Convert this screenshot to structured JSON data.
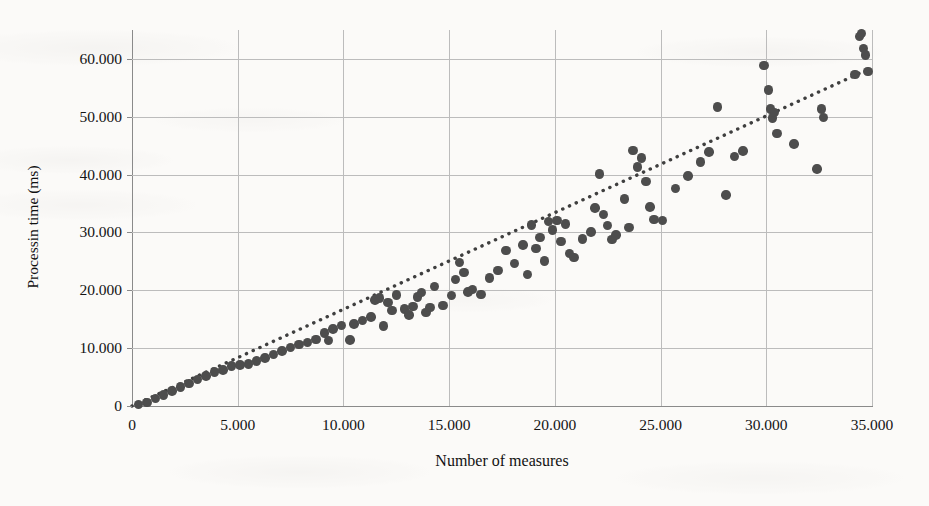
{
  "chart_data": {
    "type": "scatter",
    "title": "",
    "xlabel": "Number of measures",
    "ylabel": "Processin time (ms)",
    "xlim": [
      0,
      35000
    ],
    "ylim": [
      0,
      65000
    ],
    "grid": true,
    "legend": null,
    "xticks": [
      0,
      5000,
      10000,
      15000,
      20000,
      25000,
      30000,
      35000
    ],
    "xtick_labels": [
      "0",
      "5.000",
      "10.000",
      "15.000",
      "20.000",
      "25.000",
      "30.000",
      "35.000"
    ],
    "yticks": [
      0,
      10000,
      20000,
      30000,
      40000,
      50000,
      60000
    ],
    "ytick_labels": [
      "0",
      "10.000",
      "20.000",
      "30.000",
      "40.000",
      "50.000",
      "60.000"
    ],
    "marker_color": "#4d4d4d",
    "marker_size_px": 9.5,
    "gridline_color": "#bcbcbc",
    "axis_color": "#8a8a8a",
    "background_color": "#fbfaf8",
    "series": [
      {
        "name": "measurements",
        "marker": "circle",
        "points": [
          [
            300,
            300
          ],
          [
            700,
            600
          ],
          [
            1100,
            1300
          ],
          [
            1500,
            1900
          ],
          [
            1900,
            2600
          ],
          [
            2300,
            3300
          ],
          [
            2700,
            3900
          ],
          [
            3100,
            4600
          ],
          [
            3500,
            5200
          ],
          [
            3900,
            5900
          ],
          [
            4300,
            6200
          ],
          [
            4700,
            6900
          ],
          [
            5100,
            7100
          ],
          [
            5500,
            7300
          ],
          [
            5900,
            7800
          ],
          [
            6300,
            8300
          ],
          [
            6700,
            8900
          ],
          [
            7100,
            9500
          ],
          [
            7500,
            10100
          ],
          [
            7900,
            10600
          ],
          [
            8300,
            11000
          ],
          [
            8700,
            11500
          ],
          [
            9100,
            12600
          ],
          [
            9300,
            11300
          ],
          [
            9500,
            13300
          ],
          [
            9900,
            13900
          ],
          [
            10300,
            11400
          ],
          [
            10500,
            14200
          ],
          [
            10900,
            14800
          ],
          [
            11300,
            15400
          ],
          [
            11500,
            18300
          ],
          [
            11700,
            18700
          ],
          [
            11900,
            13800
          ],
          [
            12100,
            17900
          ],
          [
            12300,
            16500
          ],
          [
            12500,
            19200
          ],
          [
            12900,
            16800
          ],
          [
            13100,
            15700
          ],
          [
            13300,
            17200
          ],
          [
            13500,
            18800
          ],
          [
            13700,
            19600
          ],
          [
            13900,
            16200
          ],
          [
            14100,
            17000
          ],
          [
            14300,
            20700
          ],
          [
            14700,
            17400
          ],
          [
            15100,
            19100
          ],
          [
            15300,
            21900
          ],
          [
            15500,
            24800
          ],
          [
            15700,
            23100
          ],
          [
            15900,
            19700
          ],
          [
            16100,
            20100
          ],
          [
            16500,
            19300
          ],
          [
            16900,
            22100
          ],
          [
            17300,
            23400
          ],
          [
            17700,
            26900
          ],
          [
            18100,
            24600
          ],
          [
            18500,
            27800
          ],
          [
            18700,
            22700
          ],
          [
            18900,
            31300
          ],
          [
            19100,
            27200
          ],
          [
            19300,
            29100
          ],
          [
            19500,
            25100
          ],
          [
            19700,
            31900
          ],
          [
            19900,
            30400
          ],
          [
            20100,
            32100
          ],
          [
            20300,
            28400
          ],
          [
            20500,
            31500
          ],
          [
            20700,
            26400
          ],
          [
            20900,
            25700
          ],
          [
            21300,
            28900
          ],
          [
            21700,
            30100
          ],
          [
            21900,
            34200
          ],
          [
            22100,
            40100
          ],
          [
            22300,
            33100
          ],
          [
            22500,
            31200
          ],
          [
            22700,
            28800
          ],
          [
            22900,
            29600
          ],
          [
            23300,
            35800
          ],
          [
            23500,
            30900
          ],
          [
            23700,
            44200
          ],
          [
            23900,
            41300
          ],
          [
            24100,
            42900
          ],
          [
            24300,
            38800
          ],
          [
            24500,
            34400
          ],
          [
            24700,
            32200
          ],
          [
            25100,
            32100
          ],
          [
            25700,
            37600
          ],
          [
            26300,
            39800
          ],
          [
            26900,
            42200
          ],
          [
            27300,
            43900
          ],
          [
            27700,
            51700
          ],
          [
            28100,
            36500
          ],
          [
            28500,
            43100
          ],
          [
            28900,
            44100
          ],
          [
            29900,
            58900
          ],
          [
            30100,
            54600
          ],
          [
            30200,
            51300
          ],
          [
            30300,
            49800
          ],
          [
            30400,
            50700
          ],
          [
            30500,
            47100
          ],
          [
            31300,
            45300
          ],
          [
            32400,
            41000
          ],
          [
            32600,
            51300
          ],
          [
            32700,
            49900
          ],
          [
            34200,
            57300
          ],
          [
            34400,
            63900
          ],
          [
            34500,
            64400
          ],
          [
            34600,
            61800
          ],
          [
            34700,
            60700
          ],
          [
            34800,
            57800
          ]
        ]
      }
    ],
    "trendline": {
      "style": "dotted",
      "color": "#3f3f3f",
      "x_start": 0,
      "y_start": 0,
      "x_end": 35000,
      "y_end": 58500
    }
  }
}
